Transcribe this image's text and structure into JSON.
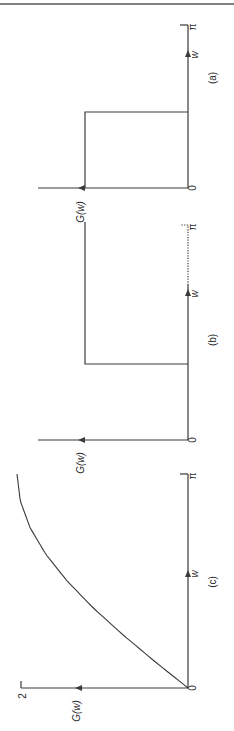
{
  "page": {
    "orientation": "rotated-90-ccw",
    "header_rule": true
  },
  "chart_data": [
    {
      "type": "line",
      "panel_label": "(a)",
      "title": "",
      "xlabel": "w",
      "ylabel": "G(w)",
      "x_tick_labels": [
        "0",
        "π"
      ],
      "xlim": [
        0,
        3.1416
      ],
      "ylim": [
        0,
        1.4
      ],
      "description": "Ideal low-pass: G(w)=1 for 0≤w<π/2, 0 for π/2<w≤π",
      "series": [
        {
          "name": "G(w)",
          "x": [
            0,
            1.5708,
            1.5708,
            3.1416
          ],
          "y": [
            1,
            1,
            0,
            0
          ]
        }
      ],
      "grid": false,
      "legend": "none"
    },
    {
      "type": "line",
      "panel_label": "(b)",
      "title": "",
      "xlabel": "w",
      "ylabel": "G(w)",
      "x_tick_labels": [
        "0",
        "π"
      ],
      "xlim": [
        0,
        3.1416
      ],
      "ylim": [
        0,
        1.4
      ],
      "description": "Ideal high-pass: G(w)=0 for 0≤w<π/2, 1 for π/2<w≤π; axis dotted near π",
      "series": [
        {
          "name": "G(w)",
          "x": [
            0,
            1.5708,
            1.5708,
            3.1416
          ],
          "y": [
            0,
            0,
            1,
            1
          ]
        }
      ],
      "grid": false,
      "legend": "none"
    },
    {
      "type": "line",
      "panel_label": "(c)",
      "title": "",
      "xlabel": "w",
      "ylabel": "G(w)",
      "x_tick_labels": [
        "0",
        "π"
      ],
      "y_tick_labels": [
        "2"
      ],
      "xlim": [
        0,
        3.1416
      ],
      "ylim": [
        0,
        2
      ],
      "description": "Differentiator-like response, G(w)=2 sin(w/2), rising from 0 to 2",
      "series": [
        {
          "name": "G(w)",
          "x": [
            0,
            0.3927,
            0.7854,
            1.1781,
            1.5708,
            1.9635,
            2.3562,
            2.7489,
            3.1416
          ],
          "y": [
            0,
            0.392,
            0.765,
            1.111,
            1.414,
            1.663,
            1.848,
            1.962,
            2.0
          ]
        }
      ],
      "grid": false,
      "legend": "none"
    }
  ],
  "labels": {
    "a": {
      "panel": "(a)",
      "x_axis": "w",
      "y_axis": "G(w)",
      "zero": "0",
      "pi": "π"
    },
    "b": {
      "panel": "(b)",
      "x_axis": "w",
      "y_axis": "G(w)",
      "zero": "0",
      "pi": "π"
    },
    "c": {
      "panel": "(c)",
      "x_axis": "w",
      "y_axis": "G(w)",
      "zero": "0",
      "pi": "π",
      "y_tick": "2"
    }
  },
  "colors": {
    "ink": "#3a3a3a",
    "background": "#ffffff"
  }
}
